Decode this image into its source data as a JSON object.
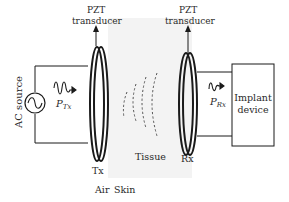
{
  "diagram": {
    "labels": {
      "tx_transducer_line1": "PZT",
      "tx_transducer_line2": "transducer",
      "rx_transducer_line1": "PZT",
      "rx_transducer_line2": "transducer",
      "ac_source": "AC source",
      "p_tx_symbol": "P",
      "p_tx_sub": "Tx",
      "p_rx_symbol": "P",
      "p_rx_sub": "Rx",
      "implant_line1": "Implant",
      "implant_line2": "device",
      "tx": "Tx",
      "rx": "Rx",
      "tissue": "Tissue",
      "air": "Air",
      "skin": "Skin"
    },
    "colors": {
      "stroke": "#1a1a1a",
      "tissue_fill": "#f3f3f3",
      "wave": "#555555"
    }
  }
}
